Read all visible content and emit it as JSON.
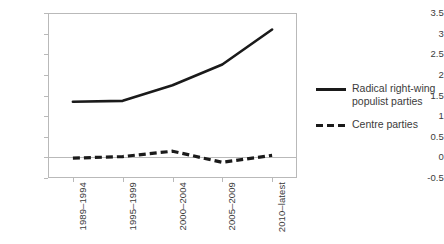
{
  "chart_data": {
    "type": "line",
    "title": "",
    "xlabel": "",
    "ylabel": "",
    "categories": [
      "1989–1994",
      "1995–1999",
      "2000–2004",
      "2005–2009",
      "2010–latest"
    ],
    "series": [
      {
        "name": "Radical right-wing populist parties",
        "style": "solid",
        "color": "#1a1a1a",
        "values": [
          1.35,
          1.37,
          1.75,
          2.25,
          3.1
        ]
      },
      {
        "name": "Centre parties",
        "style": "dashed",
        "color": "#1a1a1a",
        "values": [
          -0.02,
          0.02,
          0.15,
          -0.12,
          0.05
        ]
      }
    ],
    "ylim": [
      -0.5,
      3.5
    ],
    "yticks": [
      3.5,
      3,
      2.5,
      2,
      1.5,
      1,
      0.5,
      0,
      -0.5
    ],
    "ytick_labels": [
      "3.5",
      "3",
      "2.5",
      "2",
      "1.5",
      "1",
      "0.5",
      "0",
      "-0.5"
    ],
    "grid": false,
    "zero_line": true,
    "legend_position": "right"
  },
  "legend": {
    "entries": [
      {
        "label_line1": "Radical right-wing",
        "label_line2": "populist parties",
        "style": "solid"
      },
      {
        "label_line1": "Centre parties",
        "label_line2": "",
        "style": "dashed"
      }
    ]
  }
}
